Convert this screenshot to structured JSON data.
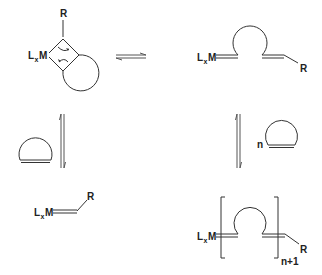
{
  "diagram": {
    "type": "reaction-scheme",
    "colors": {
      "line": "#333333",
      "arrow": "#555555",
      "text": "#222222"
    },
    "species": {
      "metallacyclobutane": {
        "metal_label": "L",
        "metal_sub": "x",
        "metal_symbol": "M",
        "substituent": "R"
      },
      "ring_opened": {
        "metal_label": "L",
        "metal_sub": "x",
        "metal_symbol": "M",
        "substituent": "R"
      },
      "cyclic_olefin": {
        "label": ""
      },
      "carbene": {
        "metal_label": "L",
        "metal_sub": "x",
        "metal_symbol": "M",
        "substituent": "R"
      },
      "monomer_n": {
        "coefficient": "n"
      },
      "polymer": {
        "metal_label": "L",
        "metal_sub": "x",
        "metal_symbol": "M",
        "substituent": "R",
        "repeat_subscript": "n+1"
      }
    },
    "arrows": [
      {
        "id": "top-equilibrium",
        "direction": "horizontal",
        "type": "equilibrium"
      },
      {
        "id": "left-equilibrium",
        "direction": "vertical",
        "type": "equilibrium"
      },
      {
        "id": "right-equilibrium",
        "direction": "vertical",
        "type": "equilibrium"
      }
    ]
  }
}
